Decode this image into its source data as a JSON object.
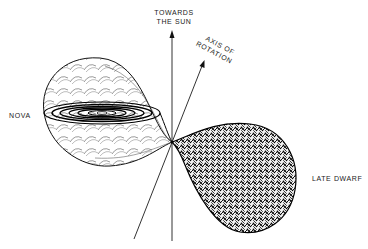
{
  "diagram": {
    "labels": {
      "towards_sun_line1": "TOWARDS",
      "towards_sun_line2": "THE SUN",
      "axis_line1": "AXIS OF",
      "axis_line2": "ROTATION",
      "nova": "NOVA",
      "late_dwarf": "LATE DWARF"
    },
    "elements": {
      "nova_lobe": "Roche lobe of nova with accretion disk",
      "dwarf_lobe": "Roche lobe of late dwarf (filled, textured)",
      "sun_axis": "arrow pointing towards the sun",
      "rotation_axis": "arrow along axis of rotation",
      "inner_lagrange_point": "contact point between lobes"
    },
    "colors": {
      "ink": "#1a1a1a",
      "background": "#ffffff"
    }
  }
}
